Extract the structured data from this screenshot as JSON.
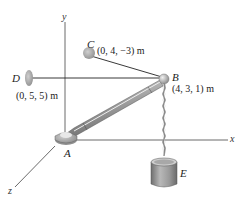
{
  "diagram": {
    "type": "3d-statics-figure",
    "axes": {
      "x_label": "x",
      "y_label": "y",
      "z_label": "z"
    },
    "points": {
      "A": {
        "label": "A"
      },
      "B": {
        "label": "B",
        "coords": "(4, 3, 1) m"
      },
      "C": {
        "label": "C",
        "coords": "(0, 4, −3) m"
      },
      "D": {
        "label": "D",
        "coords": "(0, 5, 5) m"
      },
      "E": {
        "label": "E"
      }
    },
    "members": [
      {
        "name": "boom",
        "from": "A",
        "to": "B"
      },
      {
        "name": "cable",
        "from": "B",
        "to": "C"
      },
      {
        "name": "cable",
        "from": "B",
        "to": "D"
      },
      {
        "name": "chain",
        "from": "B",
        "to": "E"
      }
    ],
    "colors": {
      "line": "#333333",
      "boom": "#9a9a9a",
      "support": "#a8a8a8",
      "bucket": "#8f8f8f"
    }
  }
}
